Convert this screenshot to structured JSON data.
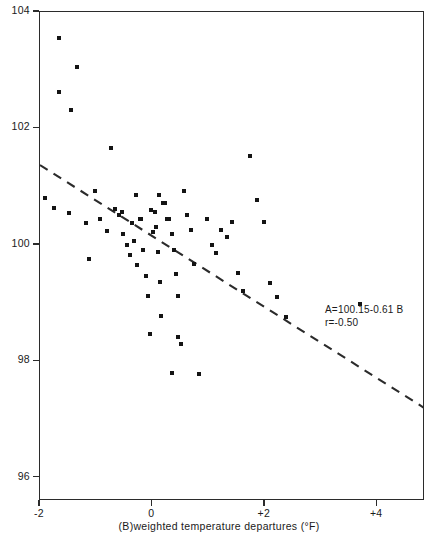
{
  "figure": {
    "background_color": "#ffffff",
    "ink_color": "#141414"
  },
  "annotations": {
    "equation": "A=100.15-0.61 B",
    "correlation": "r=-0.50"
  },
  "chart_data": {
    "type": "scatter",
    "title": "",
    "xlabel": "(B)weighted temperature departures (°F)",
    "ylabel": "(A)total electricity generation (100 = normal)",
    "xlim": [
      -2,
      4.85
    ],
    "ylim": [
      95.6,
      104
    ],
    "xticks": [
      -2,
      0,
      2,
      4
    ],
    "xticklabels": [
      "-2",
      "0",
      "+2",
      "+4"
    ],
    "yticks": [
      96,
      98,
      100,
      102,
      104
    ],
    "yticklabels": [
      "96",
      "98",
      "100",
      "102",
      "104"
    ],
    "grid": false,
    "legend": null,
    "marker": "square",
    "marker_color": "#141414",
    "trendline": {
      "style": "dashed",
      "color": "#2b2b2b",
      "equation": "A = 100.15 - 0.61 B",
      "slope": -0.61,
      "intercept": 100.15,
      "r": -0.5,
      "x_start": -2.0,
      "y_start": 101.37,
      "x_end": 4.85,
      "y_end": 97.19
    },
    "x": [
      -1.66,
      -1.34,
      -1.66,
      -1.45,
      -0.73,
      -1.92,
      -1.75,
      -1.48,
      -1.18,
      -1.12,
      -1.03,
      -0.93,
      -0.8,
      -0.66,
      -0.6,
      -0.54,
      -0.52,
      -0.45,
      -0.4,
      -0.36,
      -0.33,
      -0.28,
      -0.22,
      -0.2,
      -0.16,
      -0.12,
      -0.08,
      -0.05,
      -0.02,
      0.01,
      0.04,
      0.07,
      0.1,
      0.13,
      0.16,
      0.19,
      0.22,
      0.26,
      0.3,
      0.34,
      0.38,
      0.42,
      0.46,
      0.5,
      0.56,
      0.62,
      0.68,
      0.74,
      0.82,
      0.9,
      0.98,
      1.06,
      1.14,
      1.22,
      1.32,
      1.42,
      1.52,
      1.62,
      1.74,
      1.86,
      1.98,
      2.1,
      2.22,
      2.38,
      3.7,
      0.46,
      0.34,
      2.62,
      -0.3,
      0.12
    ],
    "y": [
      103.56,
      103.06,
      102.62,
      102.32,
      101.67,
      100.8,
      100.63,
      100.55,
      100.37,
      99.76,
      100.92,
      100.45,
      100.23,
      100.61,
      100.51,
      100.57,
      100.18,
      100.0,
      99.83,
      100.38,
      100.06,
      99.65,
      100.44,
      100.44,
      99.92,
      99.46,
      99.13,
      98.47,
      100.6,
      100.22,
      100.57,
      100.31,
      99.88,
      99.36,
      98.77,
      100.72,
      100.72,
      100.44,
      100.44,
      100.19,
      99.92,
      99.5,
      99.13,
      98.3,
      100.92,
      100.52,
      100.26,
      99.67,
      97.78,
      95.58,
      100.44,
      100.0,
      99.86,
      100.26,
      100.14,
      100.4,
      99.52,
      99.2,
      101.52,
      100.77,
      100.4,
      99.35,
      99.1,
      98.76,
      98.98,
      98.42,
      97.8,
      95.32,
      100.86,
      100.86
    ]
  },
  "axes": {
    "y_ticks": [
      {
        "label": "104",
        "value": 104
      },
      {
        "label": "102",
        "value": 102
      },
      {
        "label": "100",
        "value": 100
      },
      {
        "label": "98",
        "value": 98
      },
      {
        "label": "96",
        "value": 96
      }
    ],
    "x_ticks": [
      {
        "label": "-2",
        "value": -2
      },
      {
        "label": "0",
        "value": 0
      },
      {
        "label": "+2",
        "value": 2
      },
      {
        "label": "+4",
        "value": 4
      }
    ]
  }
}
